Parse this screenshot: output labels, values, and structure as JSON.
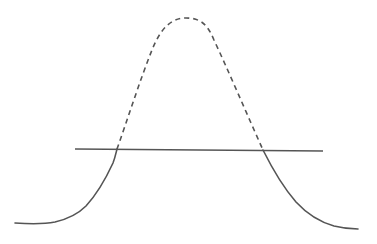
{
  "diagram": {
    "type": "threshold-curve",
    "colors": {
      "background": "#ffffff",
      "stroke": "#555555"
    },
    "curve": {
      "solid_left_start": [
        15,
        223
      ],
      "left_intersection": [
        117,
        149
      ],
      "peak": [
        190,
        18
      ],
      "right_intersection": [
        263,
        150
      ],
      "solid_right_end": [
        358,
        229
      ],
      "above_threshold_style": "dashed",
      "below_threshold_style": "solid"
    },
    "threshold_line": {
      "x1": 75,
      "y1": 149,
      "x2": 323,
      "y2": 151,
      "style": "solid"
    }
  }
}
